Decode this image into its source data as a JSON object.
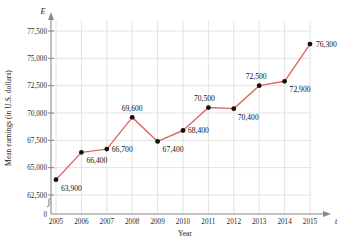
{
  "chart_data": {
    "type": "line",
    "title": "",
    "xlabel": "Year",
    "ylabel": "Mean earnings (in U.S. dollars)",
    "x_axis_symbol": "t",
    "y_axis_symbol": "E",
    "categories": [
      "2005",
      "2006",
      "2007",
      "2008",
      "2009",
      "2010",
      "2011",
      "2012",
      "2013",
      "2014",
      "2015"
    ],
    "values": [
      63900,
      66400,
      66700,
      69600,
      67400,
      68400,
      70500,
      70400,
      72500,
      72900,
      76300
    ],
    "point_labels": [
      "63,900",
      "66,400",
      "66,700",
      "69,600",
      "67,400",
      "68,400",
      "70,500",
      "70,400",
      "72,500",
      "72,900",
      "76,300"
    ],
    "y_ticks": [
      0,
      62500,
      65000,
      67500,
      70000,
      72500,
      75000,
      77500
    ],
    "y_tick_labels": [
      "0",
      "62,500",
      "65,000",
      "67,500",
      "70,000",
      "72,500",
      "75,000",
      "77,500"
    ],
    "x_tick_labels": [
      "2005",
      "2006",
      "2007",
      "2008",
      "2009",
      "2010",
      "2011",
      "2012",
      "2013",
      "2014",
      "2015"
    ],
    "ylim": [
      62500,
      78750
    ],
    "xlim": [
      2005,
      2015
    ],
    "axis_break": true,
    "grid": true,
    "legend": "none",
    "line_color": "#e0695f",
    "marker_color": "#111111",
    "grid_color": "#e2e2e2",
    "axis_color": "#8a8a8a"
  }
}
